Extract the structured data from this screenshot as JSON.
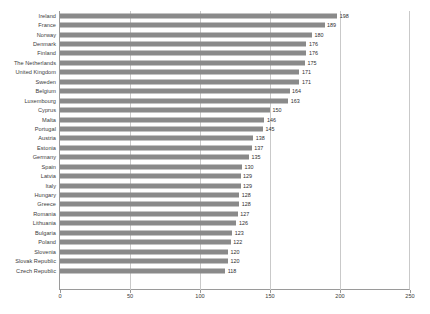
{
  "chart_data": {
    "type": "bar",
    "orientation": "horizontal",
    "title": "",
    "subtitle": "",
    "xlabel": "",
    "ylabel": "",
    "xlim": [
      0,
      250
    ],
    "xticks": [
      0,
      50,
      100,
      150,
      200,
      250
    ],
    "grid": true,
    "gridlines_at": [
      50,
      100,
      150,
      200
    ],
    "legend": null,
    "bar_color": "#8a8a8a",
    "data_labels": true,
    "categories": [
      "Ireland",
      "France",
      "Norway",
      "Denmark",
      "Finland",
      "The Netherlands",
      "United Kingdom",
      "Sweden",
      "Belgium",
      "Luxembourg",
      "Cyprus",
      "Malta",
      "Portugal",
      "Austria",
      "Estonia",
      "Germany",
      "Spain",
      "Latvia",
      "Italy",
      "Hungary",
      "Greece",
      "Romania",
      "Lithuania",
      "Bulgaria",
      "Poland",
      "Slovenia",
      "Slovak Republic",
      "Czech Republic"
    ],
    "values": [
      198,
      189,
      180,
      176,
      176,
      175,
      171,
      171,
      164,
      163,
      150,
      146,
      145,
      138,
      137,
      135,
      130,
      129,
      129,
      128,
      128,
      127,
      126,
      123,
      122,
      120,
      120,
      118
    ],
    "value_labels": [
      "198",
      "189",
      "180",
      "176",
      "176",
      "175",
      "171",
      "171",
      "164",
      "163",
      "150",
      "146",
      "145",
      "138",
      "137",
      "135",
      "130",
      "129",
      "129",
      "128",
      "128",
      "127",
      "126",
      "123",
      "122",
      "120",
      "120",
      "118"
    ],
    "xtick_labels": [
      "0",
      "50",
      "100",
      "150",
      "200",
      "250"
    ]
  }
}
